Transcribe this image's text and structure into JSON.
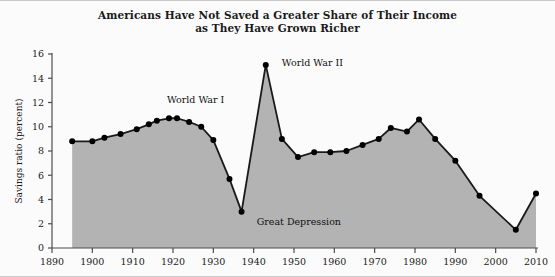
{
  "figure": {
    "title_line1": "Americans Have Not Saved a Greater Share of Their Income",
    "title_line2": "as They Have Grown Richer",
    "background_color": "#fbfbfb",
    "area_fill_color": "#b3b3b3",
    "line_color": "#1a1a1a",
    "marker_color": "#000000",
    "axis_color": "#4d4d4d",
    "border_color": "#c9c9c9"
  },
  "chart_data": {
    "type": "area",
    "title": "Americans Have Not Saved a Greater Share of Their Income as They Have Grown Richer",
    "xlabel": "",
    "ylabel": "Savings ratio (percent)",
    "xlim": [
      1890,
      2010
    ],
    "ylim": [
      0,
      16
    ],
    "xticks": [
      1890,
      1900,
      1910,
      1920,
      1930,
      1940,
      1950,
      1960,
      1970,
      1980,
      1990,
      2000,
      2010
    ],
    "xticklabels": [
      "1890",
      "1900",
      "1910",
      "1920",
      "1930",
      "1940",
      "1950",
      "1960",
      "1970",
      "1980",
      "1990",
      "2000",
      "2010"
    ],
    "yticks": [
      0,
      2,
      4,
      6,
      8,
      10,
      12,
      14,
      16
    ],
    "yticklabels": [
      "0",
      "2",
      "4",
      "6",
      "8",
      "10",
      "12",
      "14",
      "16"
    ],
    "grid": false,
    "legend": false,
    "markers": true,
    "x": [
      1895,
      1900,
      1903,
      1907,
      1911,
      1914,
      1916,
      1919,
      1921,
      1924,
      1927,
      1930,
      1934,
      1937,
      1943,
      1947,
      1951,
      1955,
      1959,
      1963,
      1967,
      1971,
      1974,
      1978,
      1981,
      1985,
      1990,
      1996,
      2005,
      2010
    ],
    "values": [
      8.8,
      8.8,
      9.1,
      9.4,
      9.8,
      10.2,
      10.5,
      10.7,
      10.7,
      10.4,
      10.0,
      8.9,
      5.7,
      3.0,
      15.1,
      9.0,
      7.5,
      7.9,
      7.9,
      8.0,
      8.5,
      9.0,
      9.9,
      9.6,
      10.6,
      9.0,
      7.2,
      4.3,
      1.5,
      4.5
    ],
    "series": [
      {
        "name": "Savings ratio",
        "values": [
          8.8,
          8.8,
          9.1,
          9.4,
          9.8,
          10.2,
          10.5,
          10.7,
          10.7,
          10.4,
          10.0,
          8.9,
          5.7,
          3.0,
          15.1,
          9.0,
          7.5,
          7.9,
          7.9,
          8.0,
          8.5,
          9.0,
          9.9,
          9.6,
          10.6,
          9.0,
          7.2,
          4.3,
          1.5,
          4.5
        ]
      }
    ],
    "annotations": [
      {
        "text": "World War I",
        "x": 1917,
        "y": 11.6
      },
      {
        "text": "World War II",
        "x": 1945,
        "y": 15.1
      },
      {
        "text": "Great Depression",
        "x": 1939,
        "y": 2.6
      }
    ]
  }
}
